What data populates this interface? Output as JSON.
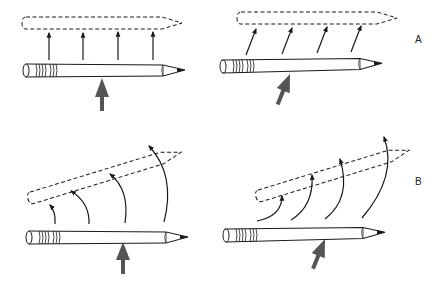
{
  "figure": {
    "labels": {
      "row_a": "A",
      "row_b": "B"
    },
    "colors": {
      "ink": "#1a1a1a",
      "force_arrow": "#555555",
      "background": "#ffffff"
    },
    "panels": [
      {
        "id": "A-left",
        "row": "A",
        "description": "Force applied at center of mass: pencil translates straight up without rotating"
      },
      {
        "id": "A-right",
        "row": "A",
        "description": "Oblique force at center of mass: pencil translates diagonally without rotating"
      },
      {
        "id": "B-left",
        "row": "B",
        "description": "Force applied off center (near tip): pencil translates and rotates"
      },
      {
        "id": "B-right",
        "row": "B",
        "description": "Oblique off-center force: pencil translates and rotates"
      }
    ]
  }
}
